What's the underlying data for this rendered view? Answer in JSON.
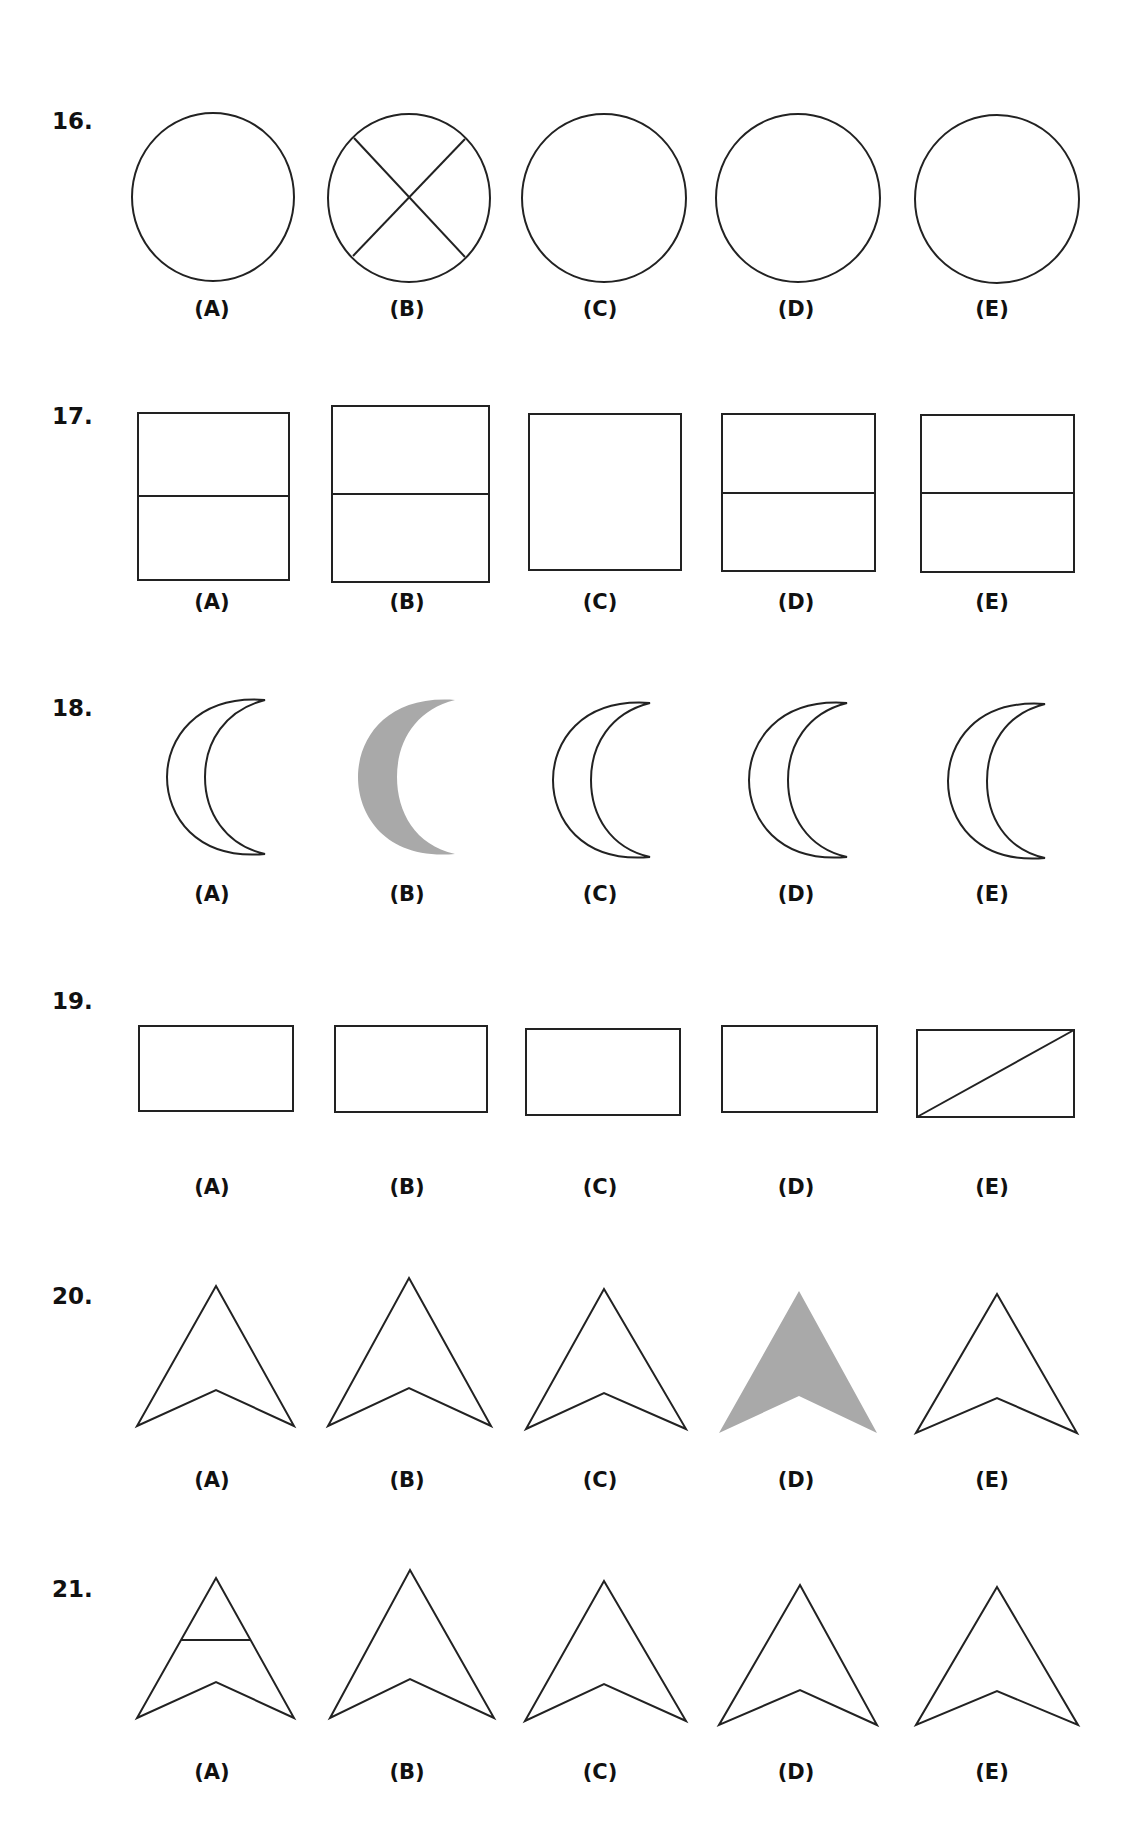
{
  "document": {
    "type": "figure-matching test page",
    "colors": {
      "ink": "#222222",
      "shade": "#a9a9a9",
      "background": "#ffffff"
    }
  },
  "questions": [
    {
      "number": "16.",
      "shape": "circle",
      "options": [
        {
          "label": "(A)",
          "variant": "plain circle"
        },
        {
          "label": "(B)",
          "variant": "circle with X through it"
        },
        {
          "label": "(C)",
          "variant": "plain circle"
        },
        {
          "label": "(D)",
          "variant": "plain circle"
        },
        {
          "label": "(E)",
          "variant": "plain circle"
        }
      ]
    },
    {
      "number": "17.",
      "shape": "rectangle",
      "options": [
        {
          "label": "(A)",
          "variant": "rectangle with horizontal midline"
        },
        {
          "label": "(B)",
          "variant": "taller rectangle with horizontal midline"
        },
        {
          "label": "(C)",
          "variant": "rectangle without midline"
        },
        {
          "label": "(D)",
          "variant": "rectangle with horizontal midline"
        },
        {
          "label": "(E)",
          "variant": "rectangle with horizontal midline"
        }
      ]
    },
    {
      "number": "18.",
      "shape": "crescent",
      "options": [
        {
          "label": "(A)",
          "variant": "outlined crescent"
        },
        {
          "label": "(B)",
          "variant": "shaded crescent"
        },
        {
          "label": "(C)",
          "variant": "outlined crescent"
        },
        {
          "label": "(D)",
          "variant": "outlined crescent"
        },
        {
          "label": "(E)",
          "variant": "outlined crescent"
        }
      ]
    },
    {
      "number": "19.",
      "shape": "wide rectangle",
      "options": [
        {
          "label": "(A)",
          "variant": "plain rectangle"
        },
        {
          "label": "(B)",
          "variant": "plain rectangle"
        },
        {
          "label": "(C)",
          "variant": "plain rectangle"
        },
        {
          "label": "(D)",
          "variant": "plain rectangle"
        },
        {
          "label": "(E)",
          "variant": "rectangle with diagonal"
        }
      ]
    },
    {
      "number": "20.",
      "shape": "arrowhead",
      "options": [
        {
          "label": "(A)",
          "variant": "outlined arrowhead"
        },
        {
          "label": "(B)",
          "variant": "taller outlined arrowhead"
        },
        {
          "label": "(C)",
          "variant": "outlined arrowhead"
        },
        {
          "label": "(D)",
          "variant": "shaded arrowhead"
        },
        {
          "label": "(E)",
          "variant": "outlined arrowhead"
        }
      ]
    },
    {
      "number": "21.",
      "shape": "arrowhead",
      "options": [
        {
          "label": "(A)",
          "variant": "arrowhead with horizontal crossbar"
        },
        {
          "label": "(B)",
          "variant": "taller outlined arrowhead"
        },
        {
          "label": "(C)",
          "variant": "outlined arrowhead"
        },
        {
          "label": "(D)",
          "variant": "outlined arrowhead"
        },
        {
          "label": "(E)",
          "variant": "outlined arrowhead"
        }
      ]
    }
  ]
}
